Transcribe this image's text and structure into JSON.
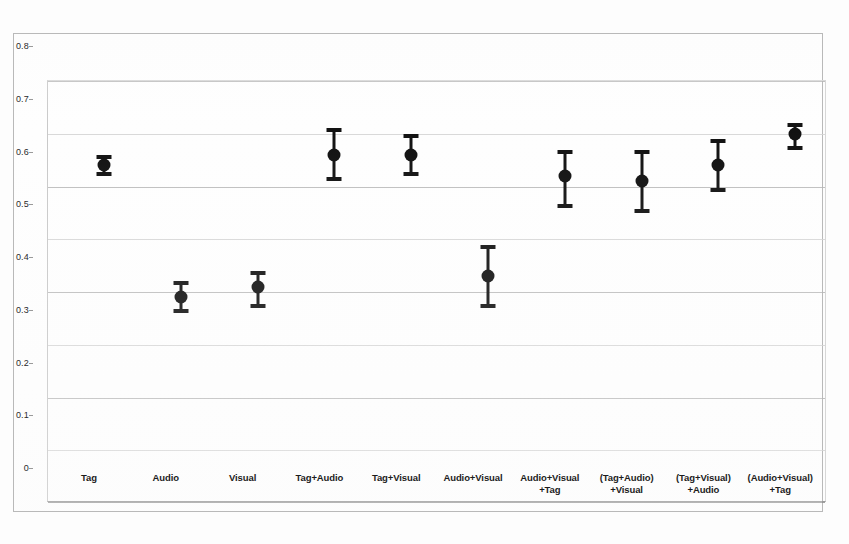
{
  "chart_data": {
    "type": "scatter",
    "title": "",
    "subtitle": "",
    "xlabel": "",
    "ylabel": "",
    "grid": true,
    "legend": "none",
    "ylim": [
      0,
      0.8
    ],
    "yticks": [
      "0",
      "0.1",
      "0.2",
      "0.3",
      "0.4",
      "0.5",
      "0.6",
      "0.7",
      "0.8"
    ],
    "ytick_values": [
      0,
      0.1,
      0.2,
      0.3,
      0.4,
      0.5,
      0.6,
      0.7,
      0.8
    ],
    "categories": [
      "Tag",
      "Audio",
      "Visual",
      "Tag+Audio",
      "Tag+Visual",
      "Audio+Visual",
      "Audio+Visual\n+Tag",
      "(Tag+Audio)\n+Visual",
      "(Tag+Visual)\n+Audio",
      "(Audio+Visual)\n+Tag"
    ],
    "category_lines": [
      {
        "line1": "Tag",
        "line2": ""
      },
      {
        "line1": "Audio",
        "line2": ""
      },
      {
        "line1": "Visual",
        "line2": ""
      },
      {
        "line1": "Tag+Audio",
        "line2": ""
      },
      {
        "line1": "Tag+Visual",
        "line2": ""
      },
      {
        "line1": "Audio+Visual",
        "line2": ""
      },
      {
        "line1": "Audio+Visual",
        "line2": "+Tag"
      },
      {
        "line1": "(Tag+Audio)",
        "line2": "+Visual"
      },
      {
        "line1": "(Tag+Visual)",
        "line2": "+Audio"
      },
      {
        "line1": "(Audio+Visual)",
        "line2": "+Tag"
      }
    ],
    "values": [
      0.64,
      0.39,
      0.41,
      0.66,
      0.66,
      0.43,
      0.62,
      0.61,
      0.64,
      0.7
    ],
    "error_low": [
      0.62,
      0.36,
      0.37,
      0.61,
      0.62,
      0.37,
      0.56,
      0.55,
      0.59,
      0.67
    ],
    "error_high": [
      0.66,
      0.42,
      0.44,
      0.71,
      0.7,
      0.49,
      0.67,
      0.67,
      0.69,
      0.72
    ],
    "series": [
      {
        "name": "mean with 95% interval",
        "points": [
          {
            "category": "Tag",
            "value": 0.64,
            "low": 0.62,
            "high": 0.66
          },
          {
            "category": "Audio",
            "value": 0.39,
            "low": 0.36,
            "high": 0.42
          },
          {
            "category": "Visual",
            "value": 0.41,
            "low": 0.37,
            "high": 0.44
          },
          {
            "category": "Tag+Audio",
            "value": 0.66,
            "low": 0.61,
            "high": 0.71
          },
          {
            "category": "Tag+Visual",
            "value": 0.66,
            "low": 0.62,
            "high": 0.7
          },
          {
            "category": "Audio+Visual",
            "value": 0.43,
            "low": 0.37,
            "high": 0.49
          },
          {
            "category": "Audio+Visual+Tag",
            "value": 0.62,
            "low": 0.56,
            "high": 0.67
          },
          {
            "category": "(Tag+Audio)+Visual",
            "value": 0.61,
            "low": 0.55,
            "high": 0.67
          },
          {
            "category": "(Tag+Visual)+Audio",
            "value": 0.64,
            "low": 0.59,
            "high": 0.69
          },
          {
            "category": "(Audio+Visual)+Tag",
            "value": 0.7,
            "low": 0.67,
            "high": 0.72
          }
        ]
      }
    ],
    "colors": {
      "marker": "#111111",
      "whisker": "#121212",
      "gridline": "#d2d2d2",
      "axis": "#9a9a9a",
      "background": "#ffffff"
    }
  }
}
